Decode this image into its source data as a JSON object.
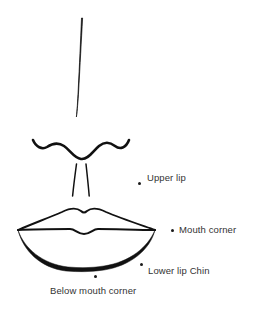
{
  "diagram": {
    "background_color": "#ffffff",
    "stroke_color": "#111111",
    "label_color": "#333333"
  },
  "drawing_parts": [
    {
      "name": "nose-bridge-line",
      "description": "long slanted vertical stroke forming the bridge of the nose"
    },
    {
      "name": "nose-base-curve",
      "description": "wavy curve forming the base of the nose and nostril wings"
    },
    {
      "name": "philtrum-left-line",
      "description": "left vertical philtrum line below the nose"
    },
    {
      "name": "philtrum-right-line",
      "description": "right vertical philtrum line below the nose"
    },
    {
      "name": "upper-lip-outline",
      "description": "cupid's bow outline of the upper lip"
    },
    {
      "name": "mouth-line",
      "description": "horizontal line where the lips meet, with a central dip"
    },
    {
      "name": "lower-lip-outline",
      "description": "rounded curve forming the bottom of the lower lip"
    }
  ],
  "annotations": [
    {
      "id": "upper_lip",
      "label": "Upper lip",
      "marker": "point-dot"
    },
    {
      "id": "mouth_corner",
      "label": "Mouth corner",
      "marker": "point-dot"
    },
    {
      "id": "lower_lip_chin",
      "label": "Lower lip Chin",
      "marker": "point-dot"
    },
    {
      "id": "below_mouth",
      "label": "Below mouth corner",
      "marker": "point-dot"
    }
  ]
}
